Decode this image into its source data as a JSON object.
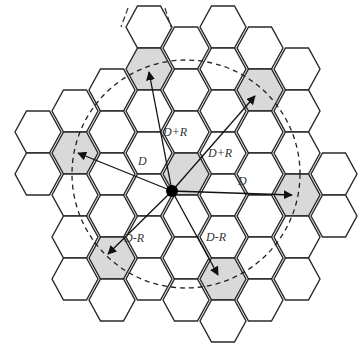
{
  "geometry": {
    "center": [
      186,
      174
    ],
    "col_step": 37,
    "row_step": 42,
    "radius": 23,
    "mobile_point": [
      172,
      191
    ]
  },
  "colors": {
    "cell_fill": "#ffffff",
    "cochannel_fill": "#d9d9d9",
    "stroke": "#2a2a2a"
  },
  "columns": [
    {
      "c": -4,
      "rows": [
        132,
        174
      ]
    },
    {
      "c": -3,
      "rows": [
        111,
        153,
        195,
        237,
        279
      ]
    },
    {
      "c": -2,
      "rows": [
        90,
        132,
        174,
        216,
        258,
        300
      ]
    },
    {
      "c": -1,
      "rows": [
        27,
        69,
        111,
        153,
        195,
        237,
        279
      ]
    },
    {
      "c": 0,
      "rows": [
        48,
        90,
        132,
        174,
        216,
        258,
        300
      ]
    },
    {
      "c": 1,
      "rows": [
        27,
        69,
        111,
        153,
        195,
        237,
        279,
        321
      ]
    },
    {
      "c": 2,
      "rows": [
        48,
        90,
        132,
        174,
        216,
        258,
        300
      ]
    },
    {
      "c": 3,
      "rows": [
        69,
        111,
        153,
        195,
        237,
        279
      ]
    },
    {
      "c": 4,
      "rows": [
        174,
        216
      ]
    }
  ],
  "cochannel_cells": [
    {
      "name": "serving",
      "x": 186,
      "y": 174
    },
    {
      "name": "top",
      "x": 149,
      "y": 69
    },
    {
      "name": "upper-right",
      "x": 260,
      "y": 90
    },
    {
      "name": "right",
      "x": 297,
      "y": 195
    },
    {
      "name": "lower-right",
      "x": 223,
      "y": 279
    },
    {
      "name": "lower-left",
      "x": 112,
      "y": 258
    },
    {
      "name": "left",
      "x": 75,
      "y": 153
    }
  ],
  "interference_circle": {
    "cx": 186,
    "cy": 174,
    "r": 114
  },
  "arrows": [
    {
      "to": "top",
      "label": "D+R",
      "x2": 149,
      "y2": 72
    },
    {
      "to": "upper-right",
      "label": "D+R",
      "x2": 255,
      "y2": 96
    },
    {
      "to": "right",
      "label": "D",
      "x2": 292,
      "y2": 195
    },
    {
      "to": "lower-right",
      "label": "D-R",
      "x2": 218,
      "y2": 275
    },
    {
      "to": "lower-left",
      "label": "D-R",
      "x2": 108,
      "y2": 254
    },
    {
      "to": "left",
      "label": "D",
      "x2": 78,
      "y2": 153
    }
  ],
  "labels": [
    {
      "id": "label-top",
      "text": "D+R",
      "x": 163,
      "y": 136
    },
    {
      "id": "label-upper-right",
      "text": "D+R",
      "x": 208,
      "y": 157
    },
    {
      "id": "label-right",
      "text": "D",
      "x": 238,
      "y": 185
    },
    {
      "id": "label-lower-right",
      "text": "D-R",
      "x": 206,
      "y": 241
    },
    {
      "id": "label-lower-left",
      "text": "D-R",
      "x": 124,
      "y": 242
    },
    {
      "id": "label-left",
      "text": "D",
      "x": 138,
      "y": 165
    }
  ]
}
